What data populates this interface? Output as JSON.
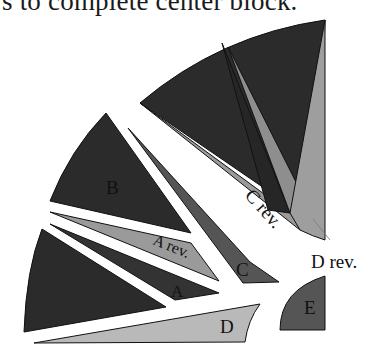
{
  "caption": "s to complete center block.",
  "colors": {
    "dark": "#2b2b2b",
    "mid": "#555555",
    "light": "#9a9a9a",
    "lighter": "#b9b9b9",
    "background": "#ffffff"
  },
  "pieces": {
    "a": {
      "label": "A"
    },
    "a_rev": {
      "label": "A rev."
    },
    "b": {
      "label": "B"
    },
    "c": {
      "label": "C"
    },
    "c_rev": {
      "label": "C rev."
    },
    "d": {
      "label": "D"
    },
    "d_rev": {
      "label": "D rev."
    },
    "e": {
      "label": "E"
    }
  }
}
